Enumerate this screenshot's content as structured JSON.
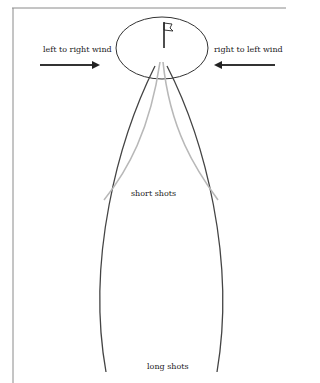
{
  "diagram": {
    "type": "golf wind drift diagram",
    "labels": {
      "left_wind": "left to right wind",
      "right_wind": "right to left wind",
      "short": "short shots",
      "long": "long shots"
    },
    "elements": {
      "green": "ellipse with flag (target)",
      "left_arrow": "arrow pointing right (wind from left)",
      "right_arrow": "arrow pointing left (wind from right)",
      "long_shot_paths": "two dark curves bowing outward from the green to the bottom",
      "short_shot_paths": "two light gray curves from the green, shorter and curving outward"
    },
    "colors": {
      "ink": "#333333",
      "light_path": "#b8b8b8",
      "frame": "#888888",
      "background": "#ffffff"
    }
  }
}
